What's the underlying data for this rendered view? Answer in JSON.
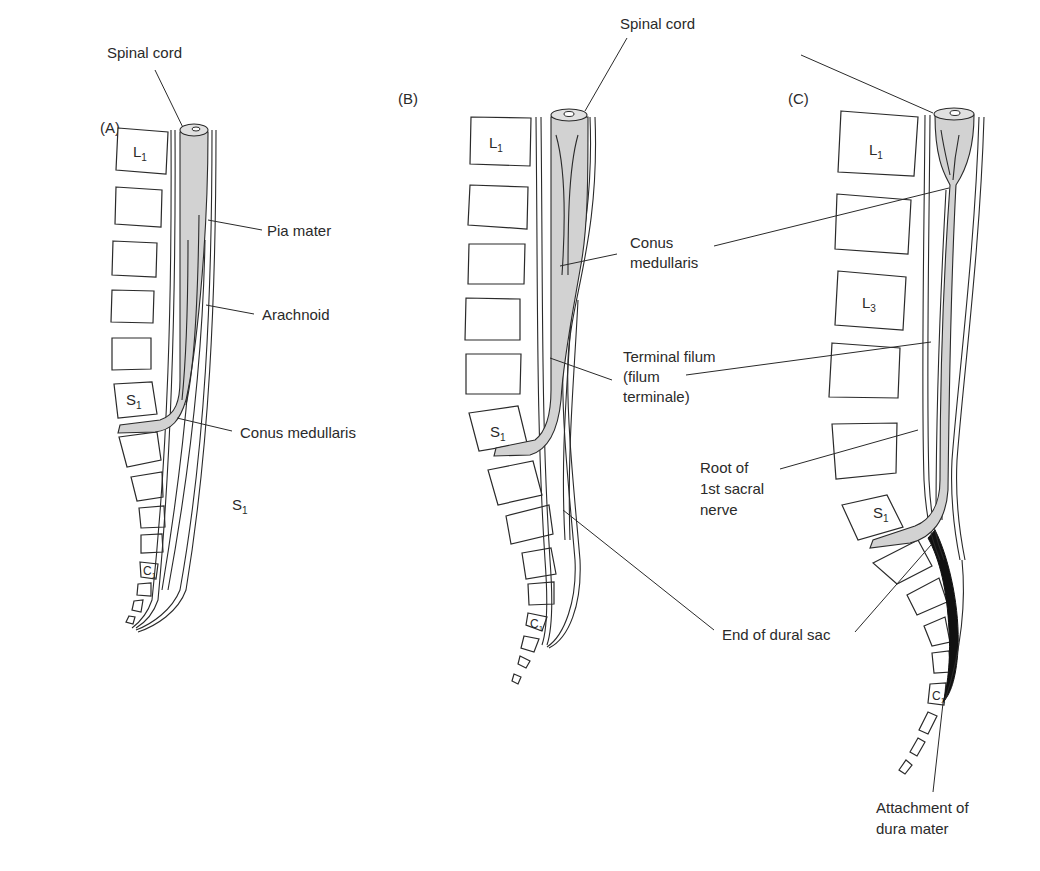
{
  "figure": {
    "panels": [
      {
        "id": "A",
        "panel_label": "(A)",
        "vertebra_labels": {
          "l1": "L",
          "l1_sub": "1",
          "s1": "S",
          "s1_sub": "1",
          "c1": "C",
          "c1_sub": "1",
          "free_s1": "S",
          "free_s1_sub": "1"
        },
        "callouts": {
          "spinal_cord": "Spinal cord",
          "pia_mater": "Pia mater",
          "arachnoid": "Arachnoid",
          "conus_medullaris": "Conus medullaris"
        }
      },
      {
        "id": "B",
        "panel_label": "(B)",
        "vertebra_labels": {
          "l1": "L",
          "l1_sub": "1",
          "s1": "S",
          "s1_sub": "1",
          "c1": "C",
          "c1_sub": "1"
        },
        "callouts": {
          "conus_medullaris_line1": "Conus",
          "conus_medullaris_line2": "medullaris",
          "terminal_filum_line1": "Terminal filum",
          "terminal_filum_line2": "(filum",
          "terminal_filum_line3": "terminale)",
          "end_of_dural_sac": "End of dural sac"
        }
      },
      {
        "id": "C",
        "panel_label": "(C)",
        "vertebra_labels": {
          "l1": "L",
          "l1_sub": "1",
          "l3": "L",
          "l3_sub": "3",
          "s1": "S",
          "s1_sub": "1",
          "c1": "C",
          "c1_sub": "1"
        },
        "callouts": {
          "root_line1": "Root of",
          "root_line2": "1st sacral",
          "root_line3": "nerve",
          "attachment_line1": "Attachment of",
          "attachment_line2": "dura mater"
        }
      }
    ],
    "shared_callouts": {
      "spinal_cord_bc": "Spinal cord"
    },
    "colors": {
      "cord_fill": "#d2d2d2",
      "line": "#2a2a2a",
      "dura_attachment": "#111111",
      "background": "#ffffff"
    }
  }
}
